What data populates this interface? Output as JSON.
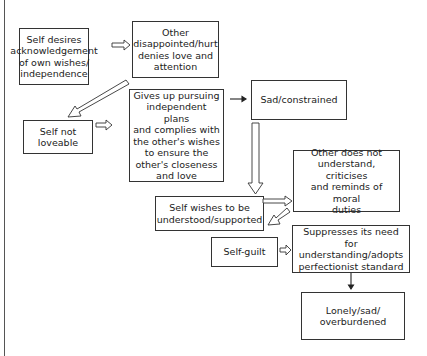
{
  "diagram": {
    "nodes": {
      "self_desires": "Self desires\nacknowledgement\nof own wishes/\nindependence",
      "other_disappointed": "Other\ndisappointed/hurt\ndenies love and\nattention",
      "self_not_loveable": "Self not\nloveable",
      "gives_up": "Gives up pursuing\nindependent plans\nand complies with\nthe other's wishes\nto ensure the\nother's closeness\nand love",
      "sad_constrained": "Sad/constrained",
      "other_does_not_understand": "Other does not\nunderstand, criticises\nand reminds of moral\nduties",
      "self_wishes_understood": "Self wishes to be\nunderstood/supported",
      "self_guilt": "Self-guilt",
      "suppresses": "Suppresses its need for\nunderstanding/adopts\nperfectionist standard",
      "lonely": "Lonely/sad/\noverburdened"
    },
    "edges": [
      {
        "from": "self_desires",
        "to": "other_disappointed",
        "style": "hollow"
      },
      {
        "from": "other_disappointed",
        "to": "self_not_loveable",
        "style": "hollow"
      },
      {
        "from": "self_not_loveable",
        "to": "gives_up",
        "style": "hollow"
      },
      {
        "from": "gives_up",
        "to": "sad_constrained",
        "style": "solid"
      },
      {
        "from": "sad_constrained",
        "to": "self_wishes_understood",
        "style": "hollow"
      },
      {
        "from": "self_wishes_understood",
        "to": "other_does_not_understand",
        "style": "hollow"
      },
      {
        "from": "other_does_not_understand",
        "to": "self_guilt",
        "style": "hollow"
      },
      {
        "from": "self_guilt",
        "to": "suppresses",
        "style": "hollow"
      },
      {
        "from": "suppresses",
        "to": "lonely",
        "style": "solid"
      }
    ]
  }
}
